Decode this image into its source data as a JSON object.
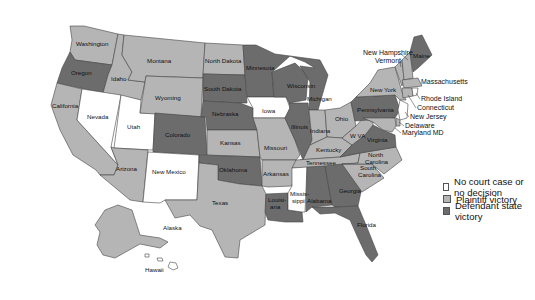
{
  "colors": {
    "none": "#ffffff",
    "plaintiff": "#b5b5b5",
    "defendant": "#6c6c6c"
  },
  "legend": [
    {
      "label": "No court case or no decision",
      "category": "none"
    },
    {
      "label": "Plaintiff victory",
      "category": "plaintiff"
    },
    {
      "label": "Defendant state victory",
      "category": "defendant"
    }
  ],
  "states": {
    "washington": {
      "label": "Washington",
      "category": "plaintiff"
    },
    "oregon": {
      "label": "Oregon",
      "category": "defendant"
    },
    "california": {
      "label": "California",
      "category": "plaintiff"
    },
    "idaho": {
      "label": "Idaho",
      "category": "plaintiff"
    },
    "nevada": {
      "label": "Nevada",
      "category": "none"
    },
    "utah": {
      "label": "Utah",
      "category": "none"
    },
    "arizona": {
      "label": "Arizona",
      "category": "plaintiff"
    },
    "montana": {
      "label": "Montana",
      "category": "plaintiff"
    },
    "wyoming": {
      "label": "Wyoming",
      "category": "plaintiff"
    },
    "colorado": {
      "label": "Colorado",
      "category": "defendant"
    },
    "new_mexico": {
      "label": "New Mexico",
      "category": "none"
    },
    "north_dakota": {
      "label": "North Dakota",
      "category": "plaintiff"
    },
    "south_dakota": {
      "label": "South Dakota",
      "category": "defendant"
    },
    "nebraska": {
      "label": "Nebraska",
      "category": "defendant"
    },
    "kansas": {
      "label": "Kansas",
      "category": "plaintiff"
    },
    "oklahoma": {
      "label": "Oklahoma",
      "category": "defendant"
    },
    "texas": {
      "label": "Texas",
      "category": "plaintiff"
    },
    "minnesota": {
      "label": "Minnesota",
      "category": "defendant"
    },
    "iowa": {
      "label": "Iowa",
      "category": "none"
    },
    "missouri": {
      "label": "Missouri",
      "category": "plaintiff"
    },
    "arkansas": {
      "label": "Arkansas",
      "category": "plaintiff"
    },
    "louisiana": {
      "label": "Louisi-\nana",
      "label_lines": [
        "Louisi-",
        "ana"
      ],
      "category": "defendant"
    },
    "wisconsin": {
      "label": "Wisconsin",
      "category": "defendant"
    },
    "illinois": {
      "label": "Illinois",
      "category": "defendant"
    },
    "michigan": {
      "label": "Michigan",
      "category": "defendant"
    },
    "indiana": {
      "label": "Indiana",
      "category": "plaintiff"
    },
    "ohio": {
      "label": "Ohio",
      "category": "plaintiff"
    },
    "kentucky": {
      "label": "Kentucky",
      "category": "plaintiff"
    },
    "tennessee": {
      "label": "Tennessee",
      "category": "plaintiff"
    },
    "mississippi": {
      "label": "Missis-\nsippi",
      "label_lines": [
        "Missis-",
        "sippi"
      ],
      "category": "none"
    },
    "alabama": {
      "label": "Alabama",
      "category": "defendant"
    },
    "georgia": {
      "label": "Georgia",
      "category": "defendant"
    },
    "florida": {
      "label": "Florida",
      "category": "defendant"
    },
    "south_carolina": {
      "label": "South\nCarolina",
      "label_lines": [
        "South",
        "Carolina"
      ],
      "category": "plaintiff"
    },
    "north_carolina": {
      "label": "North\nCarolina",
      "label_lines": [
        "North",
        "Carolina"
      ],
      "category": "plaintiff"
    },
    "virginia": {
      "label": "Virginia",
      "category": "defendant"
    },
    "west_virginia": {
      "label": "W VA",
      "category": "plaintiff"
    },
    "pennsylvania": {
      "label": "Pennsylvania",
      "category": "defendant"
    },
    "new_york": {
      "label": "New York",
      "category": "plaintiff"
    },
    "vermont": {
      "label": "Vermont",
      "category": "plaintiff"
    },
    "new_hampshire": {
      "label": "New Hampshire",
      "category": "plaintiff"
    },
    "maine": {
      "label": "Maine",
      "category": "defendant"
    },
    "massachusetts": {
      "label": "Massachusetts",
      "category": "plaintiff"
    },
    "rhode_island": {
      "label": "Rhode Island",
      "category": "none"
    },
    "connecticut": {
      "label": "Connecticut",
      "category": "plaintiff"
    },
    "new_jersey": {
      "label": "New Jersey",
      "category": "none"
    },
    "delaware": {
      "label": "Delaware",
      "category": "plaintiff"
    },
    "maryland": {
      "label": "Maryland MD",
      "category": "plaintiff"
    },
    "alaska": {
      "label": "Alaska",
      "category": "plaintiff"
    },
    "hawaii": {
      "label": "Hawaii",
      "category": "none"
    }
  }
}
